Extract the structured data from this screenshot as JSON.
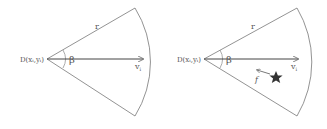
{
  "panels": [
    {
      "apex_label": "D(xᵢ,yᵢ)",
      "radius_label": "r",
      "angle_label": "β",
      "velocity_label": "v",
      "velocity_sub": "i"
    },
    {
      "apex_label": "D(xᵢ,yᵢ)",
      "radius_label": "r",
      "angle_label": "β",
      "velocity_label": "v",
      "velocity_sub": "i",
      "force_label": "f",
      "target_icon": "star"
    }
  ],
  "colors": {
    "line": "#777777",
    "text": "#555555",
    "star": "#333333"
  }
}
